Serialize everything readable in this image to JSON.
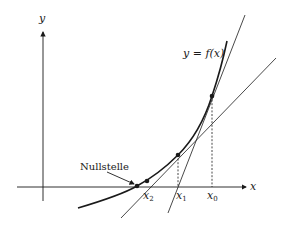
{
  "figure": {
    "type": "newton-method-diagram",
    "axes": {
      "x_label": "x",
      "y_label": "y"
    },
    "curve_label": {
      "prefix": "y = ",
      "func": "f",
      "arg": "(x)"
    },
    "root_label": "Nullstelle",
    "iterates": [
      {
        "name": "x",
        "index": "0"
      },
      {
        "name": "x",
        "index": "1"
      },
      {
        "name": "x",
        "index": "2"
      }
    ],
    "colors": {
      "ink": "#1a1a1a",
      "background": "#ffffff"
    }
  }
}
